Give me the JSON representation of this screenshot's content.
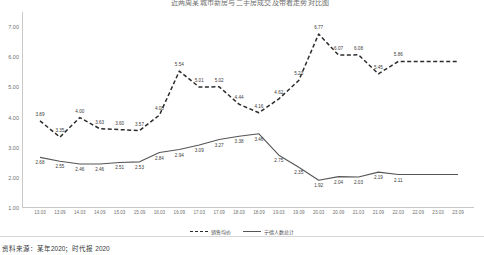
{
  "chart_title": "近两周某城市新房与二手房成交及带看走势对比图",
  "caption": "资料来源：某年2020；时代报 2020",
  "legend": {
    "position": "bottom-center",
    "entries": [
      {
        "label": "销售均价",
        "style": "dashed"
      },
      {
        "label": "宁德人数总计",
        "style": "solid"
      }
    ]
  },
  "chart_data": {
    "type": "line",
    "title": "近两周某城市新房与二手房成交及带看走势对比图",
    "xlabel": "",
    "ylabel": "",
    "ylim": [
      1.0,
      7.5
    ],
    "yticks": [
      "1.00",
      "2.00",
      "3.00",
      "4.00",
      "5.00",
      "6.00",
      "7.00"
    ],
    "ytick_values": [
      1.0,
      2.0,
      3.0,
      4.0,
      5.0,
      6.0,
      7.0
    ],
    "grid": false,
    "legend_position": "bottom-center",
    "categories": [
      "13.03",
      "13.09",
      "14.03",
      "14.09",
      "15.03",
      "15.09",
      "16.03",
      "16.09",
      "17.03",
      "17.09",
      "18.03",
      "18.09",
      "19.03",
      "19.09",
      "20.03",
      "20.09",
      "21.03",
      "21.09",
      "22.03",
      "22.09",
      "23.03",
      "23.09"
    ],
    "series": [
      {
        "name": "销售均价",
        "style": "dashed",
        "color": "#2b2b2b",
        "values": [
          3.89,
          3.35,
          4.0,
          3.63,
          3.6,
          3.57,
          4.08,
          5.54,
          5.01,
          5.02,
          4.44,
          4.16,
          4.62,
          5.23,
          6.77,
          6.07,
          6.08,
          5.45,
          5.86,
          5.86,
          5.86,
          5.86
        ]
      },
      {
        "name": "宁德人数总计",
        "style": "solid",
        "color": "#555555",
        "values": [
          2.68,
          2.55,
          2.46,
          2.46,
          2.51,
          2.53,
          2.84,
          2.94,
          3.09,
          3.27,
          3.38,
          3.46,
          2.75,
          2.35,
          1.92,
          2.04,
          2.03,
          2.19,
          2.11,
          2.11,
          2.11,
          2.11
        ]
      }
    ]
  }
}
